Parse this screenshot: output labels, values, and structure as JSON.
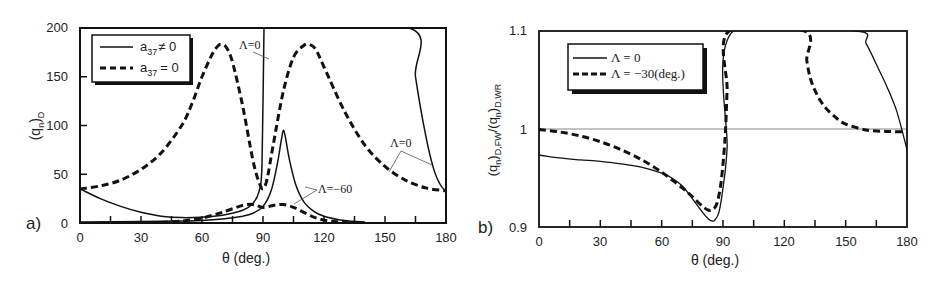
{
  "chart_data": [
    {
      "panel": "a)",
      "type": "line",
      "title": "",
      "xlabel": "θ (deg.)",
      "ylabel": "(q_n)_D",
      "xlim": [
        0,
        180
      ],
      "ylim": [
        0,
        200
      ],
      "xticks": [
        0,
        30,
        60,
        90,
        120,
        150,
        180
      ],
      "yticks": [
        0,
        50,
        100,
        150,
        200
      ],
      "grid": false,
      "legend_position": "upper-left",
      "legend": [
        {
          "label": "a37 ≠ 0",
          "style": "solid"
        },
        {
          "label": "a37 = 0",
          "style": "dashed"
        }
      ],
      "annotations": [
        "Λ=0",
        "Λ=0",
        "Λ=−60"
      ],
      "series": [
        {
          "name": "a37 ≠ 0, Λ=0",
          "style": "solid",
          "x": [
            0,
            10,
            20,
            30,
            40,
            50,
            60,
            70,
            80,
            85,
            88,
            89.5,
            90.5,
            91,
            162,
            165,
            170,
            174,
            177,
            180
          ],
          "y": [
            35,
            25,
            17,
            11,
            7,
            5.5,
            6,
            8,
            13,
            20,
            32,
            60,
            200,
            200,
            200,
            150,
            90,
            55,
            40,
            32
          ]
        },
        {
          "name": "a37 = 0, Λ=0",
          "style": "dashed",
          "x": [
            0,
            10,
            20,
            30,
            40,
            50,
            55,
            60,
            65,
            68,
            70,
            72,
            75,
            80,
            85,
            88,
            90,
            92,
            95,
            100,
            105,
            110,
            113,
            116,
            120,
            130,
            140,
            150,
            160,
            170,
            180
          ],
          "y": [
            35,
            38,
            44,
            55,
            72,
            100,
            122,
            150,
            173,
            182,
            183,
            180,
            165,
            120,
            65,
            42,
            35,
            45,
            80,
            135,
            170,
            182,
            183,
            178,
            160,
            115,
            80,
            58,
            44,
            36,
            33
          ]
        },
        {
          "name": "a37 ≠ 0, Λ=−60",
          "style": "solid",
          "x": [
            0,
            30,
            50,
            60,
            70,
            80,
            85,
            90,
            94,
            97,
            99,
            100,
            101,
            103,
            106,
            110,
            115,
            120,
            130,
            140
          ],
          "y": [
            1,
            1.5,
            2,
            2.5,
            4,
            7,
            10,
            17,
            33,
            60,
            85,
            95,
            88,
            65,
            40,
            22,
            12,
            7,
            2.5,
            1
          ]
        },
        {
          "name": "a37 = 0, Λ=−60",
          "style": "dashed",
          "x": [
            40,
            50,
            60,
            70,
            80,
            85,
            90,
            95,
            100,
            105,
            110,
            115,
            120,
            125,
            130,
            140
          ],
          "y": [
            0.5,
            2,
            5,
            11,
            18,
            19,
            16,
            18,
            19,
            16,
            11,
            6,
            3,
            1.5,
            0.5,
            0
          ]
        }
      ]
    },
    {
      "panel": "b)",
      "type": "line",
      "title": "",
      "xlabel": "θ (deg.)",
      "ylabel": "(q_n)_D,FW / (q_n)_D,WR",
      "xlim": [
        0,
        180
      ],
      "ylim": [
        0.9,
        1.1
      ],
      "xticks": [
        0,
        30,
        60,
        90,
        120,
        150,
        180
      ],
      "yticks": [
        0.9,
        1,
        1.1
      ],
      "reference_line": 1.0,
      "grid": false,
      "legend_position": "upper-left",
      "legend": [
        {
          "label": "Λ = 0",
          "style": "solid"
        },
        {
          "label": "Λ = −30(deg.)",
          "style": "dashed"
        }
      ],
      "series": [
        {
          "name": "Λ = 0",
          "style": "solid",
          "x": [
            0,
            10,
            20,
            30,
            40,
            50,
            60,
            65,
            70,
            75,
            80,
            83,
            85,
            86,
            88,
            90,
            92,
            95,
            155,
            160,
            165,
            170,
            175,
            180
          ],
          "y": [
            0.9735,
            0.9705,
            0.9685,
            0.967,
            0.9645,
            0.961,
            0.955,
            0.95,
            0.942,
            0.929,
            0.915,
            0.908,
            0.906,
            0.907,
            0.915,
            0.94,
            0.98,
            1.1,
            1.1,
            1.087,
            1.066,
            1.044,
            1.018,
            0.979
          ]
        },
        {
          "name": "Λ = −30(deg.)",
          "style": "dashed",
          "x": [
            0,
            10,
            20,
            30,
            40,
            50,
            60,
            70,
            75,
            80,
            83,
            85,
            87,
            89,
            91,
            92,
            93,
            130,
            131,
            133,
            136,
            140,
            145,
            150,
            160,
            170,
            180
          ],
          "y": [
            0.9995,
            0.997,
            0.993,
            0.987,
            0.979,
            0.969,
            0.956,
            0.94,
            0.931,
            0.921,
            0.917,
            0.918,
            0.924,
            0.945,
            0.99,
            1.04,
            1.1,
            1.1,
            1.07,
            1.05,
            1.035,
            1.022,
            1.012,
            1.005,
            0.999,
            0.9975,
            0.997
          ]
        }
      ]
    }
  ],
  "labels": {
    "a": {
      "panel": "a)",
      "ylabel_base": "(q",
      "ylabel_sub_n": "n",
      "ylabel_close": ")",
      "ylabel_sub_D": "D",
      "xlabel": "θ (deg.)",
      "legend_solid_base": "a",
      "legend_solid_sub": "37",
      "legend_solid_rest": "≠ 0",
      "legend_dashed_base": "a",
      "legend_dashed_sub": "37",
      "legend_dashed_rest": "= 0",
      "annot_top": "Λ=0",
      "annot_right": "Λ=0",
      "annot_mid": "Λ=−60",
      "yticks": [
        "0",
        "50",
        "100",
        "150",
        "200"
      ],
      "xticks": [
        "0",
        "30",
        "60",
        "90",
        "120",
        "150",
        "180"
      ]
    },
    "b": {
      "panel": "b)",
      "ylabel": "(q_n)_D,FW/(q_n)_D,WR",
      "xlabel": "θ (deg.)",
      "legend_solid": "Λ = 0",
      "legend_dashed": "Λ = −30(deg.)",
      "yticks": [
        "0.9",
        "1",
        "1.1"
      ],
      "xticks": [
        "0",
        "30",
        "60",
        "90",
        "120",
        "150",
        "180"
      ]
    }
  }
}
